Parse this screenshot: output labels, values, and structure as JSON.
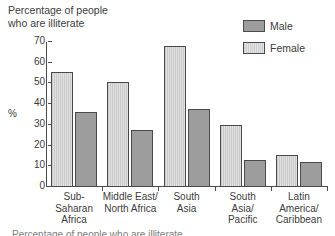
{
  "chart_data": {
    "type": "bar",
    "title": "Percentage of people\nwho are illiterate",
    "xlabel": "",
    "ylabel": "%",
    "ylim": [
      0,
      70
    ],
    "yticks": [
      0,
      10,
      20,
      30,
      40,
      50,
      60,
      70
    ],
    "ytick_labels": [
      "0",
      "10",
      "20",
      "30",
      "40",
      "50",
      "60",
      "70"
    ],
    "grid": false,
    "legend_position": "top-right",
    "categories": [
      "Sub-\nSaharan\nAfrica",
      "Middle East/\nNorth Africa",
      "South\nAsia",
      "South\nAsia/\nPacific",
      "Latin\nAmerica/\nCaribbean"
    ],
    "series": [
      {
        "name": "Female",
        "values": [
          55.5,
          50.5,
          68,
          30,
          15.5
        ],
        "color": "#d6d6d6",
        "pattern": "vertical-hatch"
      },
      {
        "name": "Male",
        "values": [
          36,
          27.5,
          37.5,
          13,
          12
        ],
        "color": "#9d9d9d",
        "pattern": "solid"
      }
    ]
  },
  "legend": {
    "items": [
      {
        "label": "Male"
      },
      {
        "label": "Female"
      }
    ]
  },
  "caption": {
    "bottom_cut_text": "Percentage of people who are illiterate"
  },
  "colors": {
    "male": "#9d9d9d",
    "female": "#d6d6d6",
    "axis": "#4d4d4d",
    "text": "#3c3c3c",
    "background": "#ffffff"
  }
}
